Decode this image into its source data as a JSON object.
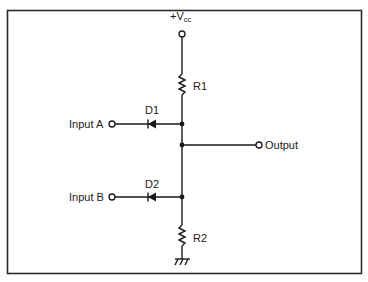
{
  "diagram": {
    "type": "diode-resistor OR/AND gate schematic",
    "supply": {
      "label_main": "+V",
      "label_sub": "cc"
    },
    "components": [
      {
        "id": "R1",
        "label": "R1",
        "kind": "resistor"
      },
      {
        "id": "R2",
        "label": "R2",
        "kind": "resistor"
      },
      {
        "id": "D1",
        "label": "D1",
        "kind": "diode"
      },
      {
        "id": "D2",
        "label": "D2",
        "kind": "diode"
      }
    ],
    "inputs": [
      {
        "id": "A",
        "label": "Input A"
      },
      {
        "id": "B",
        "label": "Input B"
      }
    ],
    "output": {
      "label": "Output"
    },
    "ground": {
      "icon": "ground-icon"
    },
    "colors": {
      "line": "#1a1a1a",
      "background": "#ffffff"
    }
  }
}
